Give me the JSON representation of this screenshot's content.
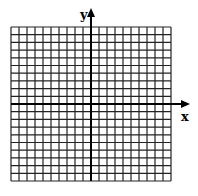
{
  "diagram": {
    "type": "coordinate-grid",
    "x_axis_label": "x",
    "y_axis_label": "y",
    "grid": {
      "columns": 20,
      "rows": 20,
      "cells_left_of_y_axis": 10,
      "cells_right_of_y_axis": 10,
      "cells_above_x_axis": 10,
      "cells_below_x_axis": 10
    },
    "colors": {
      "grid_line": "#222222",
      "axis": "#000000",
      "background": "#ffffff"
    }
  }
}
